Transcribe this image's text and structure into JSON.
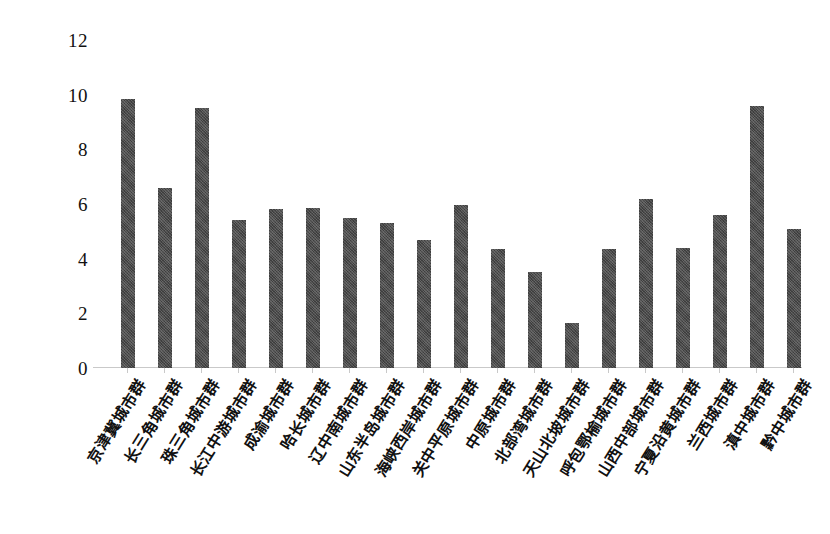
{
  "chart_data": {
    "type": "bar",
    "title": "",
    "subtitle": "",
    "xlabel": "",
    "ylabel": "",
    "ylim": [
      0,
      12
    ],
    "yticks": [
      0,
      2,
      4,
      6,
      8,
      10,
      12
    ],
    "grid": false,
    "legend": null,
    "bar_color": "#4b4b4b",
    "axis_color": "#c9c9c9",
    "categories": [
      "京津冀城市群",
      "长三角城市群",
      "珠三角城市群",
      "长江中游城市群",
      "成渝城市群",
      "哈长城市群",
      "辽中南城市群",
      "山东半岛城市群",
      "海峡西岸城市群",
      "关中平原城市群",
      "中原城市群",
      "北部湾城市群",
      "天山北坡城市群",
      "呼包鄂榆城市群",
      "山西中部城市群",
      "宁夏沿黄城市群",
      "兰西城市群",
      "滇中城市群",
      "黔中城市群"
    ],
    "values": [
      9.85,
      6.6,
      9.5,
      5.4,
      5.8,
      5.85,
      5.5,
      5.3,
      4.7,
      5.95,
      4.35,
      3.5,
      1.65,
      4.35,
      6.2,
      4.4,
      5.6,
      9.6,
      5.1
    ]
  }
}
